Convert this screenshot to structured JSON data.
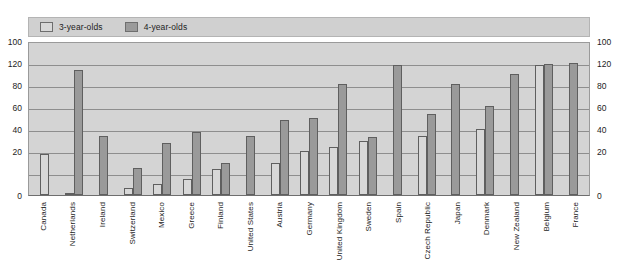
{
  "legend": {
    "items": [
      {
        "label": "3-year-olds",
        "color": "#d8d8d8",
        "icon": "legend-swatch-light"
      },
      {
        "label": "4-year-olds",
        "color": "#9a9a9a",
        "icon": "legend-swatch-dark"
      }
    ]
  },
  "axis": {
    "left_ticks": [
      "100",
      "120",
      "80",
      "60",
      "40",
      "20",
      "0"
    ],
    "right_ticks": [
      "100",
      "120",
      "80",
      "60",
      "40",
      "20",
      "0"
    ]
  },
  "chart_data": {
    "type": "bar",
    "title": "",
    "xlabel": "",
    "ylabel": "",
    "ylim": [
      0,
      140
    ],
    "yticks": [
      0,
      20,
      40,
      60,
      80,
      100,
      120,
      140
    ],
    "ytick_labels": [
      "0",
      "20",
      "40",
      "60",
      "80",
      "100",
      "120",
      "100"
    ],
    "grid": true,
    "legend_position": "top-left",
    "categories": [
      "Canada",
      "Netherlands",
      "Ireland",
      "Switzerland",
      "Mexico",
      "Greece",
      "Finland",
      "United States",
      "Austria",
      "Germany",
      "United Kingdom",
      "Sweden",
      "Spain",
      "Czech Republic",
      "Japan",
      "Denmark",
      "New Zealand",
      "Belgium",
      "France"
    ],
    "series": [
      {
        "name": "3-year-olds",
        "color": "#d8d8d8",
        "values": [
          37,
          1,
          0,
          6,
          10,
          15,
          24,
          0,
          29,
          40,
          44,
          49,
          0,
          54,
          0,
          60,
          0,
          118,
          0
        ]
      },
      {
        "name": "4-year-olds",
        "color": "#9a9a9a",
        "values": [
          0,
          114,
          54,
          25,
          47,
          57,
          29,
          54,
          68,
          70,
          101,
          53,
          118,
          74,
          101,
          81,
          110,
          119,
          120
        ]
      }
    ]
  }
}
